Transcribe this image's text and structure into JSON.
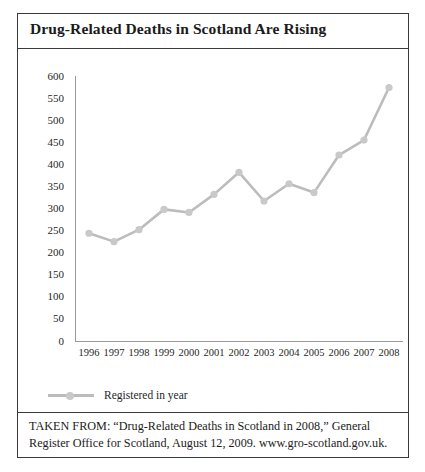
{
  "figure": {
    "title": "Drug-Related Deaths in Scotland Are Rising",
    "source_note": "TAKEN FROM: “Drug-Related Deaths in Scotland in 2008,” General Register Office for Scotland, August 12, 2009. www.gro-scotland.gov.uk."
  },
  "colors": {
    "line": "#bcbcbc",
    "marker": "#c9c9c9",
    "axis": "#9b9b9b",
    "border": "#3a3a3a",
    "text": "#1b1b1b"
  },
  "chart_data": {
    "type": "line",
    "title": "Drug-Related Deaths in Scotland Are Rising",
    "xlabel": "",
    "ylabel": "",
    "categories": [
      "1996",
      "1997",
      "1998",
      "1999",
      "2000",
      "2001",
      "2002",
      "2003",
      "2004",
      "2005",
      "2006",
      "2007",
      "2008"
    ],
    "series": [
      {
        "name": "Registered in year",
        "values": [
          244,
          225,
          252,
          298,
          291,
          332,
          382,
          317,
          356,
          336,
          421,
          455,
          574
        ]
      }
    ],
    "ylim": [
      0,
      600
    ],
    "yticks": [
      0,
      50,
      100,
      150,
      200,
      250,
      300,
      350,
      400,
      450,
      500,
      550,
      600
    ],
    "xticks": [
      "1996",
      "1997",
      "1998",
      "1999",
      "2000",
      "2001",
      "2002",
      "2003",
      "2004",
      "2005",
      "2006",
      "2007",
      "2008"
    ],
    "grid": false,
    "legend": {
      "position": "below-plot",
      "entries": [
        "Registered in year"
      ]
    },
    "markers": "circle"
  }
}
